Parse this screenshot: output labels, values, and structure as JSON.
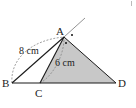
{
  "diagram": {
    "type": "geometry",
    "points": {
      "A": {
        "label": "A",
        "x": 64,
        "y": 37
      },
      "B": {
        "label": "B",
        "x": 12,
        "y": 83
      },
      "C": {
        "label": "C",
        "x": 40,
        "y": 83
      },
      "D": {
        "label": "D",
        "x": 116,
        "y": 83
      }
    },
    "measurements": {
      "AB": "8 cm",
      "AC": "6 cm"
    },
    "shaded_region": "triangle ACD",
    "colors": {
      "shade": "#c8c8c8",
      "line": "#1a1a1a",
      "dashed": "#888888"
    }
  }
}
